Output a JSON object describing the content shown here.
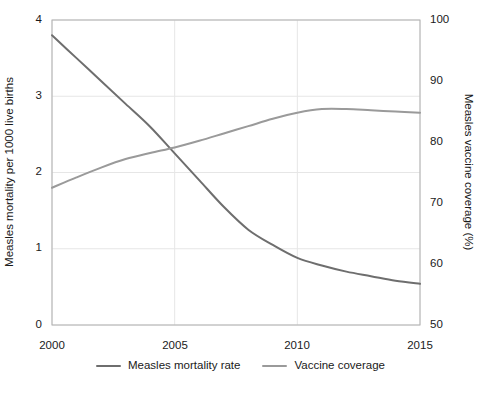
{
  "chart_data": {
    "type": "line",
    "title": "",
    "subtitle": "",
    "xlabel": "",
    "ylabel": "Measles mortality per 1000 live births",
    "y2label": "Measles vaccine coverage (%)",
    "x": [
      2000,
      2001,
      2002,
      2003,
      2004,
      2005,
      2006,
      2007,
      2008,
      2009,
      2010,
      2011,
      2012,
      2013,
      2014,
      2015
    ],
    "xlim": [
      2000,
      2015
    ],
    "ylim": [
      0,
      4
    ],
    "y2lim": [
      50,
      100
    ],
    "xticks": [
      "2000",
      "2005",
      "2010",
      "2015"
    ],
    "yticks": [
      "0",
      "1",
      "2",
      "3",
      "4"
    ],
    "y2ticks": [
      "50",
      "60",
      "70",
      "80",
      "90",
      "100"
    ],
    "grid": true,
    "legend_position": "bottom",
    "series": [
      {
        "name": "Measles mortality rate",
        "axis": "left",
        "color": "#6e6e6e",
        "values": [
          3.8,
          3.5,
          3.2,
          2.9,
          2.6,
          2.25,
          1.9,
          1.55,
          1.25,
          1.05,
          0.88,
          0.78,
          0.7,
          0.64,
          0.58,
          0.54
        ]
      },
      {
        "name": "Vaccine coverage",
        "axis": "right",
        "color": "#9a9a9a",
        "values": [
          72.5,
          74.2,
          75.8,
          77.2,
          78.2,
          79.1,
          80.2,
          81.4,
          82.6,
          83.8,
          84.8,
          85.4,
          85.4,
          85.2,
          85.0,
          84.8
        ]
      }
    ]
  },
  "legend": {
    "items": [
      {
        "label": "Measles mortality rate",
        "color": "#6e6e6e"
      },
      {
        "label": "Vaccine coverage",
        "color": "#9a9a9a"
      }
    ]
  },
  "colors": {
    "mortality_line": "#6e6e6e",
    "coverage_line": "#9a9a9a",
    "grid": "#e6e6e6",
    "axis": "#b0b0b0",
    "text": "#1a1a1a",
    "background": "#ffffff"
  }
}
